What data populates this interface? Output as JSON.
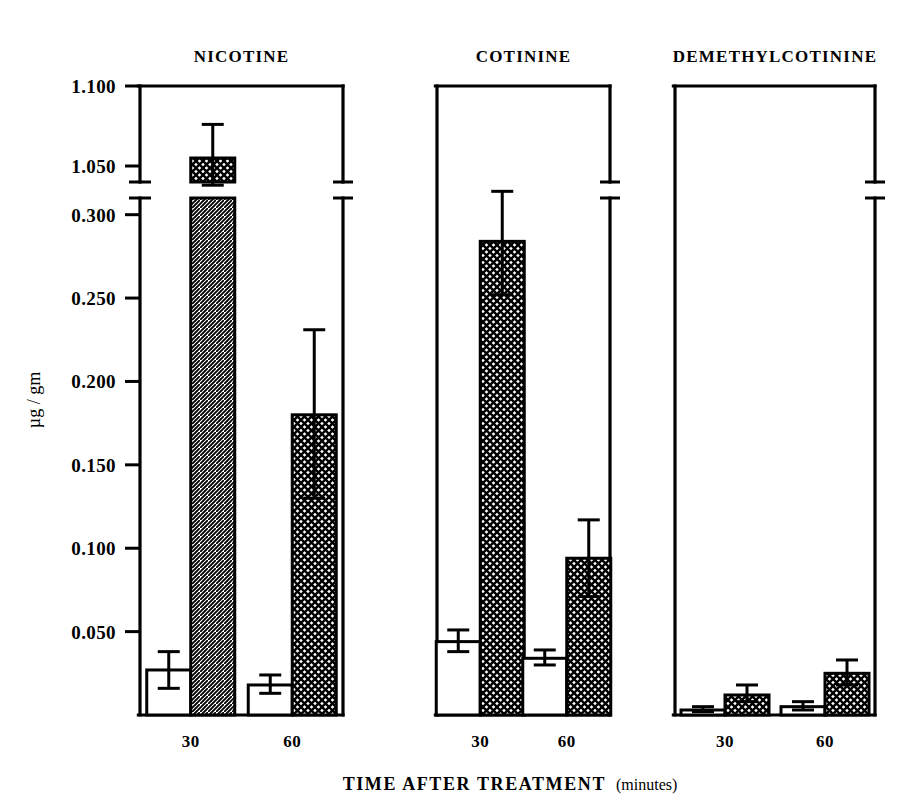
{
  "figure": {
    "y_axis_title": "µg / gm",
    "x_axis_title": "TIME  AFTER  TREATMENT",
    "x_axis_title_suffix": "(minutes)",
    "background_color": "#ffffff",
    "ink_color": "#000000"
  },
  "chart_data": {
    "type": "bar",
    "title": "",
    "xlabel": "TIME AFTER TREATMENT (minutes)",
    "ylabel": "µg / gm",
    "grid": false,
    "legend": false,
    "broken_axis": true,
    "axis_break_note": "y-axis broken between 0.300 and 1.050",
    "ylim_lower": [
      0.0,
      0.31
    ],
    "ylim_upper": [
      1.04,
      1.1
    ],
    "ytick_labels_upper": [
      "1.100",
      "1.050"
    ],
    "ytick_values_upper": [
      1.1,
      1.05
    ],
    "ytick_labels_lower": [
      "0.300",
      "0.250",
      "0.200",
      "0.150",
      "0.100",
      "0.050"
    ],
    "ytick_values_lower": [
      0.3,
      0.25,
      0.2,
      0.15,
      0.1,
      0.05
    ],
    "categories": [
      "30",
      "60"
    ],
    "panels": [
      {
        "title": "NICOTINE",
        "groups": [
          {
            "category": "30",
            "bars": [
              {
                "series": "open",
                "value": 0.027,
                "err_low": 0.016,
                "err_high": 0.038
              },
              {
                "series": "hatched",
                "value": 1.055,
                "err_low": 1.038,
                "err_high": 1.076
              }
            ]
          },
          {
            "category": "60",
            "bars": [
              {
                "series": "open",
                "value": 0.018,
                "err_low": 0.013,
                "err_high": 0.024
              },
              {
                "series": "hatched",
                "value": 0.18,
                "err_low": 0.13,
                "err_high": 0.231
              }
            ]
          }
        ]
      },
      {
        "title": "COTININE",
        "groups": [
          {
            "category": "30",
            "bars": [
              {
                "series": "open",
                "value": 0.044,
                "err_low": 0.038,
                "err_high": 0.051
              },
              {
                "series": "hatched",
                "value": 0.284,
                "err_low": 0.252,
                "err_high": 0.314
              }
            ]
          },
          {
            "category": "60",
            "bars": [
              {
                "series": "open",
                "value": 0.034,
                "err_low": 0.03,
                "err_high": 0.039
              },
              {
                "series": "hatched",
                "value": 0.094,
                "err_low": 0.071,
                "err_high": 0.117
              }
            ]
          }
        ]
      },
      {
        "title": "DEMETHYLCOTININE",
        "groups": [
          {
            "category": "30",
            "bars": [
              {
                "series": "open",
                "value": 0.003,
                "err_low": 0.002,
                "err_high": 0.005
              },
              {
                "series": "hatched",
                "value": 0.012,
                "err_low": 0.008,
                "err_high": 0.018
              }
            ]
          },
          {
            "category": "60",
            "bars": [
              {
                "series": "open",
                "value": 0.005,
                "err_low": 0.003,
                "err_high": 0.008
              },
              {
                "series": "hatched",
                "value": 0.025,
                "err_low": 0.018,
                "err_high": 0.033
              }
            ]
          }
        ]
      }
    ]
  }
}
